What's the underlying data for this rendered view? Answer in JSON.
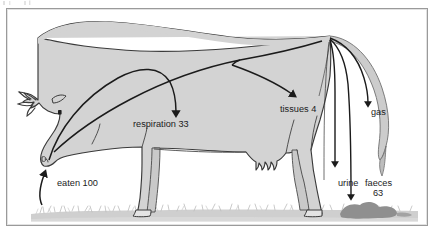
{
  "figure": {
    "border_color": "#9a9a9a",
    "background_color": "#ffffff",
    "body_fill": "#d3d3d3",
    "body_stroke": "#3a3a3a",
    "arrow_color": "#1b1b1b",
    "grass_color": "#cfcfcf",
    "dung_color": "#8f8f8f",
    "tail_fill": "#cccccc"
  },
  "flows": [
    {
      "id": "eaten",
      "label": "eaten 100",
      "value": "100",
      "name": "eaten",
      "direction": "in"
    },
    {
      "id": "respiration",
      "label": "respiration 33",
      "value": "33",
      "name": "respiration",
      "direction": "out"
    },
    {
      "id": "tissues",
      "label": "tissues 4",
      "value": "4",
      "name": "tissues",
      "direction": "out"
    },
    {
      "id": "gas",
      "label": "gas",
      "value": "",
      "name": "gas",
      "direction": "out"
    },
    {
      "id": "urine",
      "label": "urine",
      "value": "",
      "name": "urine",
      "direction": "out"
    },
    {
      "id": "faeces",
      "label": "faeces",
      "value": "63",
      "name": "faeces",
      "direction": "out"
    }
  ],
  "labels": {
    "eaten": "eaten 100",
    "respiration": "respiration 33",
    "tissues": "tissues 4",
    "gas": "gas",
    "urine": "urine",
    "faeces_word": "faeces",
    "faeces_value": "63"
  }
}
